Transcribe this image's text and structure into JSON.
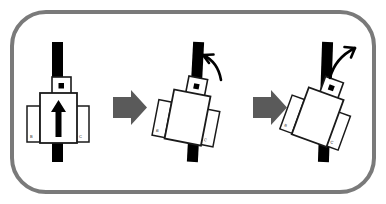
{
  "figure": {
    "type": "instructional-diagram",
    "title": "",
    "background_color": "#ffffff",
    "border": {
      "shape": "rounded-rectangle",
      "color": "#7a7a7a",
      "stroke_width": 4,
      "corner_radius": 34
    },
    "panel_count": 3,
    "step_arrow": {
      "glyph": "block-arrow-right",
      "color": "#5a5a5a",
      "count": 2
    }
  },
  "panels": [
    {
      "index": 1,
      "name": "upright-state",
      "rotation_degrees": 0,
      "rail": {
        "name": "vertical-rail",
        "color": "#000000"
      },
      "body": {
        "name": "carriage-body",
        "fill": "#ffffff",
        "stroke": "#1a1a1a"
      },
      "sensor": {
        "name": "sensor-module",
        "marker": "dot",
        "fill": "#ffffff",
        "stroke": "#1a1a1a"
      },
      "direction_arrow": {
        "glyph": "arrow-up",
        "color": "#000000",
        "visible": true
      },
      "side_left": {
        "label": "B",
        "fill": "#ffffff",
        "stroke": "#1a1a1a"
      },
      "side_right": {
        "label": "C",
        "fill": "#ffffff",
        "stroke": "#1a1a1a"
      },
      "rotation_arrow": {
        "visible": false,
        "glyph": "",
        "direction": ""
      }
    },
    {
      "index": 2,
      "name": "tilted-state",
      "rotation_degrees": 11,
      "rail": {
        "name": "vertical-rail",
        "color": "#000000"
      },
      "body": {
        "name": "carriage-body",
        "fill": "#ffffff",
        "stroke": "#1a1a1a"
      },
      "sensor": {
        "name": "sensor-module",
        "marker": "dot",
        "fill": "#ffffff",
        "stroke": "#1a1a1a"
      },
      "direction_arrow": {
        "glyph": "arrow-up",
        "color": "#000000",
        "visible": false
      },
      "side_left": {
        "label": "B",
        "fill": "#ffffff",
        "stroke": "#1a1a1a"
      },
      "side_right": {
        "label": "C",
        "fill": "#ffffff",
        "stroke": "#1a1a1a"
      },
      "rotation_arrow": {
        "visible": true,
        "glyph": "curved-arrow-up-left",
        "direction": "counterclockwise",
        "color": "#000000"
      }
    },
    {
      "index": 3,
      "name": "further-tilted-state",
      "rotation_degrees": 20,
      "rail": {
        "name": "vertical-rail",
        "color": "#000000"
      },
      "body": {
        "name": "carriage-body",
        "fill": "#ffffff",
        "stroke": "#1a1a1a"
      },
      "sensor": {
        "name": "sensor-module",
        "marker": "dot",
        "fill": "#ffffff",
        "stroke": "#1a1a1a"
      },
      "direction_arrow": {
        "glyph": "arrow-up",
        "color": "#000000",
        "visible": false
      },
      "side_left": {
        "label": "B",
        "fill": "#ffffff",
        "stroke": "#1a1a1a"
      },
      "side_right": {
        "label": "C",
        "fill": "#ffffff",
        "stroke": "#1a1a1a"
      },
      "rotation_arrow": {
        "visible": true,
        "glyph": "curved-arrow-up-right",
        "direction": "clockwise",
        "color": "#000000"
      }
    }
  ],
  "colors": {
    "ink": "#1a1a1a",
    "rail": "#000000",
    "frame": "#7a7a7a",
    "step_arrow": "#5a5a5a",
    "paper": "#ffffff"
  }
}
